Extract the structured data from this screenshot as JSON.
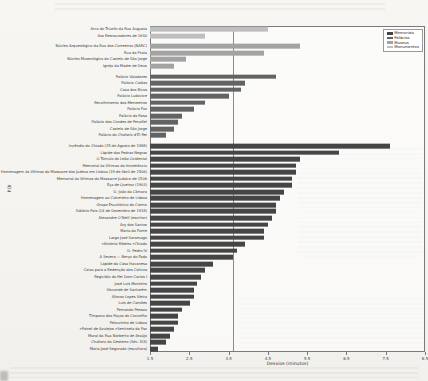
{
  "chart_data": {
    "type": "bar",
    "orientation": "horizontal",
    "xlabel": "Desvios (minutos)",
    "ylabel": "POI",
    "xlim": [
      1.5,
      8.5
    ],
    "xticks": [
      1.5,
      2.5,
      3.5,
      4.5,
      5.5,
      6.5,
      7.5,
      8.5
    ],
    "reference_line_x": 3.6,
    "grid": false,
    "legend_position": "upper right",
    "legend_entries": [
      {
        "label": "Memoriais",
        "color": "#454545"
      },
      {
        "label": "Palácios",
        "color": "#636363"
      },
      {
        "label": "Museus",
        "color": "#a3a3a3"
      },
      {
        "label": "Monumentos",
        "color": "#bfbfbf"
      }
    ],
    "groups": [
      {
        "category": "Monumentos",
        "color": "#bfbfbf",
        "items": [
          {
            "label": "Arco do Triunfo da Rua Augusta",
            "value": 4.5
          },
          {
            "label": "Aos Restauradores de 1640",
            "value": 2.9
          }
        ]
      },
      {
        "category": "Museus",
        "color": "#a3a3a3",
        "items": [
          {
            "label": "Núcleo Arqueológico da Rua dos Correeiros (NARC)",
            "value": 5.3
          },
          {
            "label": "Rua da Prata",
            "value": 4.4
          },
          {
            "label": "Núcleo Museológico do Castelo de São Jorge",
            "value": 2.4
          },
          {
            "label": "Igreja da Madre de Deus",
            "value": 2.1
          }
        ]
      },
      {
        "category": "Palácios",
        "color": "#636363",
        "items": [
          {
            "label": "Palácio Valadares",
            "value": 4.7
          },
          {
            "label": "Palácio Caldas",
            "value": 3.9
          },
          {
            "label": "Casa dos Bicos",
            "value": 3.8
          },
          {
            "label": "Palácio Ludovice",
            "value": 3.5
          },
          {
            "label": "Recolhimento dos Merceeiros",
            "value": 2.9
          },
          {
            "label": "Palácio Foz",
            "value": 2.6
          },
          {
            "label": "Palácio da Rosa",
            "value": 2.3
          },
          {
            "label": "Palácio dos Condes de Penafiel",
            "value": 2.2
          },
          {
            "label": "Castelo de São Jorge",
            "value": 2.1
          },
          {
            "label": "Palácio do Chafariz d'El Rei",
            "value": 1.9
          }
        ]
      },
      {
        "category": "Memoriais",
        "color": "#454545",
        "items": [
          {
            "label": "Incêndio do Chiado (25 de Agosto de 1988)",
            "value": 7.6
          },
          {
            "label": "Lápide das Pedras Negras",
            "value": 6.3
          },
          {
            "label": "O Túmulo do Leão Ocidental",
            "value": 5.3
          },
          {
            "label": "Memorial às Vítimas da Intolerância",
            "value": 5.2
          },
          {
            "label": "Homenagem às Vítimas do Massacre dos Judeus em Lisboa (19 de Abril de 1506)",
            "value": 5.2
          },
          {
            "label": "Memorial às Vítimas do Massacre Judaico de 1506",
            "value": 5.1
          },
          {
            "label": "Eça de Queiroz (1903)",
            "value": 5.1
          },
          {
            "label": "D. João da Câmara",
            "value": 4.9
          },
          {
            "label": "Homenagem ao Calceteiro de Lisboa",
            "value": 4.8
          },
          {
            "label": "Grupo Escultórico do Carmo",
            "value": 4.7
          },
          {
            "label": "Sidónio Pais (14 de Dezembro de 1918)",
            "value": 4.7
          },
          {
            "label": "Alexandre O'Neill (escritor)",
            "value": 4.6
          },
          {
            "label": "Ary dos Santos",
            "value": 4.5
          },
          {
            "label": "Maria da Fonte",
            "value": 4.4
          },
          {
            "label": "Largo José Saramago",
            "value": 4.4
          },
          {
            "label": "António Ribeiro «Chiado»",
            "value": 3.9
          },
          {
            "label": "D. Pedro IV",
            "value": 3.7
          },
          {
            "label": "A Severa — Berço do Fado",
            "value": 3.6
          },
          {
            "label": "Lápide da Casa Havanesa",
            "value": 3.1
          },
          {
            "label": "Caixa para a Redenção dos Cativos",
            "value": 2.9
          },
          {
            "label": "Regicídio do Rei Dom Carlos I",
            "value": 2.8
          },
          {
            "label": "José Luís Monteiro",
            "value": 2.7
          },
          {
            "label": "Visconde de Santarém",
            "value": 2.6
          },
          {
            "label": "Afonso Lopes Vieira",
            "value": 2.6
          },
          {
            "label": "Luís de Camões",
            "value": 2.5
          },
          {
            "label": "Fernando Pessoa",
            "value": 2.3
          },
          {
            "label": "Tímpano dos Paços do Concelho",
            "value": 2.2
          },
          {
            "label": "Pelourinho de Lisboa",
            "value": 2.2
          },
          {
            "label": "Painel de Azulejos «Sentinela da Paz»",
            "value": 2.1
          },
          {
            "label": "Mural da Rua Norberto de Araújo",
            "value": 2.0
          },
          {
            "label": "Chafariz do Desterro (Séc. XIX)",
            "value": 1.9
          },
          {
            "label": "Maria José Segurado (escultora)",
            "value": 1.7
          }
        ]
      }
    ]
  }
}
